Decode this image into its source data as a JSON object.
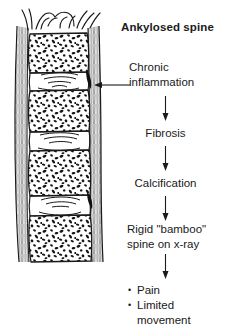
{
  "figure": {
    "title": "Ankylosed spine",
    "background_color": "#ffffff",
    "ink_color": "#1a1a1a"
  },
  "illustration": {
    "name": "ankylosed-spine-drawing",
    "description": "Pen-and-ink lateral view of an ankylosed vertebral column",
    "vertebra_count": 4,
    "disc_count": 3
  },
  "callout": {
    "label_line_1": "Chronic",
    "label_line_2": "inflammation",
    "leader_direction": "left",
    "points_to": "spinal ligament margin"
  },
  "flow": {
    "steps": [
      {
        "label": "Fibrosis"
      },
      {
        "label": "Calcification"
      }
    ],
    "outcome_line_1": "Rigid \"bamboo\"",
    "outcome_line_2": "spine on x-ray"
  },
  "outcomes": {
    "bullet_glyph": "•",
    "items": [
      {
        "text": "Pain"
      },
      {
        "text": "Limited\nmovement"
      }
    ]
  }
}
